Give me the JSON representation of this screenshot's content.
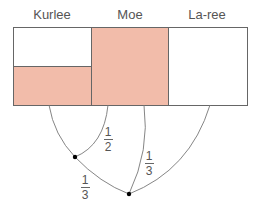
{
  "diagram": {
    "people": [
      {
        "name": "Kurlee",
        "label_x": 52
      },
      {
        "name": "Moe",
        "label_x": 130
      },
      {
        "name": "La-ree",
        "label_x": 207
      }
    ],
    "boxes": [
      {
        "person": "Kurlee",
        "x": 13,
        "y": 27,
        "w": 78,
        "h": 78,
        "shaded_fraction": 0.5
      },
      {
        "person": "Moe",
        "x": 91,
        "y": 27,
        "w": 77,
        "h": 78,
        "shaded_fraction": 1.0
      },
      {
        "person": "La-ree",
        "x": 168,
        "y": 27,
        "w": 79,
        "h": 78,
        "shaded_fraction": 0.0
      }
    ],
    "fractions": [
      {
        "id": "moe-to-kurlee",
        "numerator": "1",
        "denominator": "2"
      },
      {
        "id": "moe-to-join",
        "numerator": "1",
        "denominator": "3"
      },
      {
        "id": "node-to-join",
        "numerator": "1",
        "denominator": "3"
      }
    ],
    "colors": {
      "fill": "#F2BCAA",
      "stroke": "#666666",
      "text": "#555555"
    }
  }
}
